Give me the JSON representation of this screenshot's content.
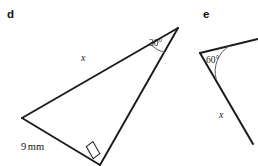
{
  "figure": {
    "background_color": "#ffffff",
    "stroke_color": "#1b1b1b",
    "arc_color": "#5a5a5a",
    "parts": [
      {
        "id": "d",
        "label": "d",
        "shape": "right-triangle",
        "labels": {
          "hypotenuse": "x",
          "base": "9 mm",
          "base_value": "9",
          "base_unit": "mm",
          "angle_at_apex": "30°",
          "angle_value": "30",
          "angle_unit": "°",
          "right_angle_marker": "square"
        },
        "vertices": {
          "left": [
            22,
            118
          ],
          "apex": [
            178,
            28
          ],
          "bottom": [
            100,
            164
          ]
        }
      },
      {
        "id": "e",
        "label": "e",
        "shape": "angle-with-two-rays",
        "labels": {
          "ray_label": "x",
          "angle": "60°",
          "angle_value": "60",
          "angle_unit": "°"
        },
        "vertices": {
          "apex": [
            200,
            53
          ],
          "ray_upper_end": [
            258,
            40
          ],
          "ray_lower_end": [
            252,
            143
          ]
        }
      }
    ]
  }
}
